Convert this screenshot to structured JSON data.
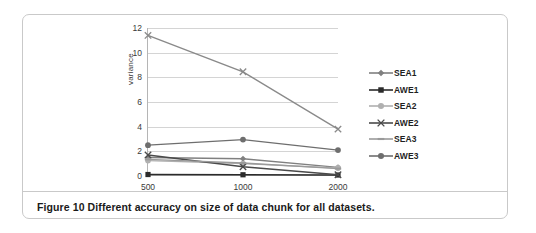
{
  "figure": {
    "caption": "Figure 10 Different accuracy on size of data chunk for all datasets."
  },
  "chart_data": {
    "type": "line",
    "title": "",
    "xlabel": "",
    "ylabel": "variance",
    "categories": [
      "500",
      "1000",
      "2000"
    ],
    "x_values": [
      500,
      1000,
      2000
    ],
    "ylim": [
      0,
      12
    ],
    "yticks": [
      0,
      2,
      4,
      6,
      8,
      10,
      12
    ],
    "ytick_labels": [
      "0",
      "2",
      "4",
      "6",
      "8",
      "10",
      "12"
    ],
    "grid": true,
    "legend_position": "right",
    "series": [
      {
        "name": "SEA1",
        "values": [
          1.5,
          1.4,
          0.7
        ],
        "color": "#808080",
        "marker": "diamond"
      },
      {
        "name": "AWE1",
        "values": [
          0.12,
          0.1,
          0.08
        ],
        "color": "#2b2b2b",
        "marker": "square"
      },
      {
        "name": "SEA2",
        "values": [
          1.25,
          1.0,
          0.65
        ],
        "color": "#b0b0b0",
        "marker": "circle"
      },
      {
        "name": "AWE2",
        "values": [
          1.7,
          0.75,
          0.1
        ],
        "color": "#4a4a4a",
        "marker": "cross"
      },
      {
        "name": "SEA3",
        "values": [
          1.35,
          1.05,
          0.6
        ],
        "color": "#9a9a9a",
        "marker": "dash"
      },
      {
        "name": "AWE3",
        "values": [
          2.5,
          2.95,
          2.1
        ],
        "color": "#6e6e6e",
        "marker": "circle"
      }
    ],
    "overlay_series": [
      {
        "name": "AWE3-high",
        "values": [
          11.4,
          8.45,
          3.8
        ],
        "color": "#8a8a8a",
        "marker": "cross"
      }
    ],
    "annotations": []
  }
}
